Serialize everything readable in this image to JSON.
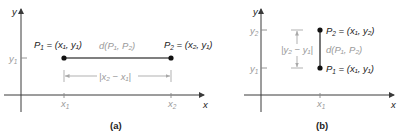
{
  "panels": [
    {
      "id": "a",
      "caption": "(a)",
      "axis_labels": {
        "x": "x",
        "y": "y"
      },
      "tick_labels": {
        "y1": "y",
        "y1_sub": "1",
        "x1": "x",
        "x1_sub": "1",
        "x2": "x",
        "x2_sub": "2"
      },
      "point1": {
        "name": "P",
        "sub": "1",
        "coords_text": " = (x₁, y₁)"
      },
      "point2": {
        "name": "P",
        "sub": "2",
        "coords_text": " = (x₂, y₁)"
      },
      "distance_label": "d(P₁, P₂)",
      "dimension_label": "|x₂ − x₁|"
    },
    {
      "id": "b",
      "caption": "(b)",
      "axis_labels": {
        "x": "x",
        "y": "y"
      },
      "tick_labels": {
        "y1": "y",
        "y1_sub": "1",
        "y2": "y",
        "y2_sub": "2",
        "x1": "x",
        "x1_sub": "1"
      },
      "point1": {
        "name": "P",
        "sub": "1",
        "coords_text": " = (x₁, y₁)"
      },
      "point2": {
        "name": "P",
        "sub": "2",
        "coords_text": " = (x₁, y₂)"
      },
      "distance_label": "d(P₁, P₂)",
      "dimension_label": "|y₂ − y₁|"
    }
  ],
  "colors": {
    "axis": "#3a3a3a",
    "segment": "#555555",
    "label_dark": "#222222",
    "label_grey": "#9a9a9a"
  }
}
